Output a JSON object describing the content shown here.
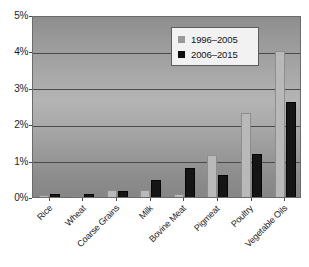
{
  "chart_data": {
    "type": "bar",
    "title": "",
    "subtitle": "",
    "xlabel": "",
    "ylabel": "",
    "ylim": [
      0,
      5
    ],
    "yunit": "%",
    "grid": true,
    "legend_position": "top-right",
    "categories": [
      "Rice",
      "Wheat",
      "Coarse Grains",
      "Milk",
      "Bovine Meat",
      "Pigmeat",
      "Poultry",
      "Vegetable Oils"
    ],
    "ytick_labels": [
      "0%",
      "1%",
      "2%",
      "3%",
      "4%",
      "5%"
    ],
    "ytick_values": [
      0,
      1,
      2,
      3,
      4,
      5
    ],
    "series": [
      {
        "name": "1996–2005",
        "color": "#b9b9b9",
        "values": [
          0.05,
          0.03,
          0.18,
          0.2,
          0.07,
          1.15,
          2.3,
          4.0
        ]
      },
      {
        "name": "2006–2015",
        "color": "#151515",
        "values": [
          0.08,
          0.08,
          0.17,
          0.47,
          0.79,
          0.6,
          1.18,
          2.6
        ]
      }
    ]
  },
  "legend": {
    "entries": [
      {
        "label": "1996–2005",
        "swatch": "gray-square-icon"
      },
      {
        "label": "2006–2015",
        "swatch": "black-square-icon"
      }
    ]
  }
}
